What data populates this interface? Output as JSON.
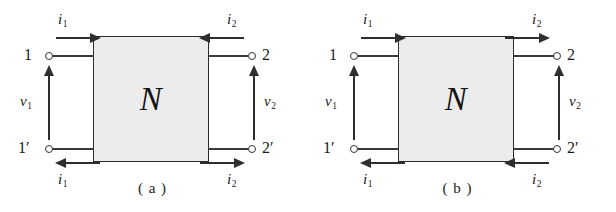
{
  "figure": {
    "type": "two-port-network-diagram",
    "network_symbol": "N",
    "background_color": "#ffffff",
    "box_fill_color": "#ececed",
    "line_color": "#2e2e2e"
  },
  "diagrams": [
    {
      "id": "a",
      "caption": "( a )",
      "network_label": "N",
      "terminals": {
        "top_left": "1",
        "bottom_left": "1′",
        "top_right": "2",
        "bottom_right": "2′"
      },
      "currents": {
        "i1_top": {
          "symbol": "i",
          "subscript": "1",
          "direction": "right"
        },
        "i1_bottom": {
          "symbol": "i",
          "subscript": "1",
          "direction": "left"
        },
        "i2_top": {
          "symbol": "i",
          "subscript": "2",
          "direction": "left"
        },
        "i2_bottom": {
          "symbol": "i",
          "subscript": "2",
          "direction": "right"
        }
      },
      "voltages": {
        "v1": {
          "symbol": "v",
          "subscript": "1",
          "direction": "up"
        },
        "v2": {
          "symbol": "v",
          "subscript": "2",
          "direction": "up"
        }
      }
    },
    {
      "id": "b",
      "caption": "( b )",
      "network_label": "N",
      "terminals": {
        "top_left": "1",
        "bottom_left": "1′",
        "top_right": "2",
        "bottom_right": "2′"
      },
      "currents": {
        "i1_top": {
          "symbol": "i",
          "subscript": "1",
          "direction": "right"
        },
        "i1_bottom": {
          "symbol": "i",
          "subscript": "1",
          "direction": "left"
        },
        "i2_top": {
          "symbol": "i",
          "subscript": "2",
          "direction": "right"
        },
        "i2_bottom": {
          "symbol": "i",
          "subscript": "2",
          "direction": "left"
        }
      },
      "voltages": {
        "v1": {
          "symbol": "v",
          "subscript": "1",
          "direction": "up"
        },
        "v2": {
          "symbol": "v",
          "subscript": "2",
          "direction": "up"
        }
      }
    }
  ]
}
